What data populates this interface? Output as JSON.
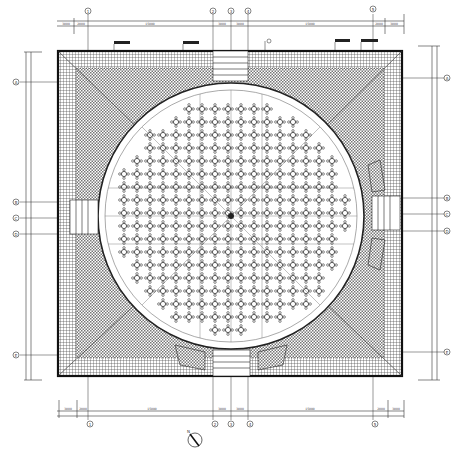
{
  "drawing": {
    "type": "architectural-floor-plan",
    "description": "Square pavilion with circular hall and radial banquet table layout",
    "colors": {
      "line": "#222222",
      "wall": "#111111",
      "hatch_outer": "#555555",
      "hatch_inner": "#888888",
      "paper": "#ffffff"
    },
    "grid_axes": {
      "top": [
        "1",
        "2",
        "3",
        "4",
        "5"
      ],
      "bottom": [
        "1",
        "2",
        "3",
        "4",
        "5"
      ],
      "left": [
        "A",
        "B",
        "C",
        "D",
        "E"
      ],
      "right": [
        "A",
        "B",
        "C",
        "D",
        "E"
      ]
    },
    "dimensions": {
      "top": [
        "3000",
        "2000",
        "15000",
        "3000",
        "3000",
        "15000",
        "2000",
        "3000"
      ],
      "bottom": [
        "3000",
        "2000",
        "15000",
        "3000",
        "3000",
        "15000",
        "2000",
        "3000"
      ],
      "left": [
        "3000",
        "2000",
        "15000",
        "2000",
        "2000",
        "15000",
        "2000",
        "3000"
      ],
      "right": [
        "3000",
        "2000",
        "15000",
        "2000",
        "2000",
        "15000",
        "2000",
        "3000"
      ]
    },
    "callouts": {
      "top": [
        "label-1",
        "label-2",
        "label-3",
        "label-4"
      ],
      "north_arrow": "N"
    },
    "hall": {
      "shape": "circle",
      "table_rows": 15,
      "center_mark": "column"
    }
  }
}
